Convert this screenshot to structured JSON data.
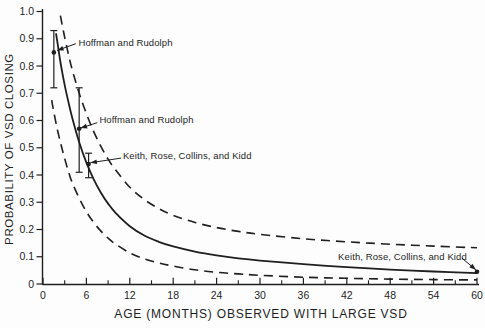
{
  "figure": {
    "background": "#fdfdfd",
    "ink_color": "#1f1f1f"
  },
  "chart_data": {
    "type": "line",
    "title": "",
    "xlabel": "AGE (MONTHS) OBSERVED WITH LARGE VSD",
    "ylabel": "PROBABILITY OF VSD CLOSING",
    "xlim": [
      0,
      60
    ],
    "ylim": [
      0,
      1.0
    ],
    "grid": false,
    "legend_position": "none",
    "x_ticks_major": [
      0,
      6,
      12,
      18,
      24,
      30,
      36,
      42,
      48,
      54,
      60
    ],
    "x_tick_labels": [
      "0",
      "6",
      "12",
      "18",
      "24",
      "30",
      "36",
      "42",
      "48",
      "54",
      "60"
    ],
    "x_ticks_minor": [
      3,
      9,
      15,
      21,
      27,
      33,
      39,
      45,
      51,
      57
    ],
    "y_ticks": [
      0,
      0.1,
      0.2,
      0.3,
      0.4,
      0.5,
      0.6,
      0.7,
      0.8,
      0.9,
      1.0
    ],
    "y_tick_labels": [
      "0",
      "0.1",
      "0.2",
      "0.3",
      "0.4",
      "0.5",
      "0.6",
      "0.7",
      "0.8",
      "0.9",
      "1.0"
    ],
    "series": [
      {
        "name": "estimated probability of closure",
        "style": "solid",
        "x": [
          1.8,
          2,
          2.5,
          3,
          3.5,
          4,
          5,
          6,
          7,
          8,
          9,
          10,
          12,
          14,
          16,
          18,
          21,
          24,
          27,
          30,
          36,
          42,
          48,
          54,
          60
        ],
        "y": [
          0.92,
          0.885,
          0.8,
          0.73,
          0.67,
          0.615,
          0.52,
          0.445,
          0.385,
          0.335,
          0.295,
          0.262,
          0.212,
          0.178,
          0.155,
          0.138,
          0.119,
          0.105,
          0.094,
          0.086,
          0.073,
          0.062,
          0.053,
          0.046,
          0.04
        ]
      },
      {
        "name": "upper confidence bound",
        "style": "dashed",
        "x": [
          2.4,
          2.7,
          3,
          3.5,
          4,
          5,
          6,
          7,
          8,
          9,
          10,
          12,
          14,
          16,
          18,
          21,
          24,
          27,
          30,
          36,
          42,
          48,
          54,
          60
        ],
        "y": [
          0.985,
          0.945,
          0.905,
          0.845,
          0.79,
          0.7,
          0.625,
          0.56,
          0.505,
          0.458,
          0.42,
          0.355,
          0.31,
          0.277,
          0.252,
          0.226,
          0.207,
          0.193,
          0.182,
          0.166,
          0.155,
          0.146,
          0.139,
          0.133
        ]
      },
      {
        "name": "lower confidence bound",
        "style": "dashed",
        "x": [
          1.2,
          1.5,
          2,
          2.5,
          3,
          3.5,
          4,
          5,
          6,
          7,
          8,
          9,
          10,
          12,
          14,
          16,
          18,
          21,
          24,
          27,
          30,
          36,
          42,
          48,
          54,
          60
        ],
        "y": [
          0.675,
          0.63,
          0.565,
          0.51,
          0.46,
          0.415,
          0.375,
          0.315,
          0.265,
          0.226,
          0.194,
          0.168,
          0.147,
          0.114,
          0.092,
          0.077,
          0.066,
          0.052,
          0.043,
          0.037,
          0.032,
          0.025,
          0.021,
          0.018,
          0.016,
          0.015
        ]
      }
    ],
    "points": [
      {
        "source": "Hoffman and Rudolph",
        "month": 1.5,
        "prob": 0.85,
        "ci_low": 0.72,
        "ci_high": 0.93
      },
      {
        "source": "Hoffman and Rudolph",
        "month": 5.0,
        "prob": 0.57,
        "ci_low": 0.41,
        "ci_high": 0.72
      },
      {
        "source": "Keith, Rose, Collins, and Kidd",
        "month": 6.3,
        "prob": 0.44,
        "ci_low": 0.39,
        "ci_high": 0.48
      },
      {
        "source": "Keith, Rose, Collins, and Kidd",
        "month": 60,
        "prob": 0.045,
        "ci_low": null,
        "ci_high": null
      }
    ],
    "annotations": [
      {
        "text": "Hoffman and Rudolph",
        "label": {
          "month": 4.9,
          "prob": 0.886
        },
        "anchor": "start",
        "leader": {
          "from": {
            "month": 4.55,
            "prob": 0.882
          },
          "to": {
            "month": 1.95,
            "prob": 0.857
          }
        }
      },
      {
        "text": "Hoffman and Rudolph",
        "label": {
          "month": 7.8,
          "prob": 0.605
        },
        "anchor": "start",
        "leader": {
          "from": {
            "month": 7.5,
            "prob": 0.592
          },
          "to": {
            "month": 5.2,
            "prob": 0.572
          }
        }
      },
      {
        "text": "Keith, Rose, Collins, and Kidd",
        "label": {
          "month": 11.05,
          "prob": 0.473
        },
        "anchor": "start",
        "leader": {
          "from": {
            "month": 10.8,
            "prob": 0.462
          },
          "to": {
            "month": 6.55,
            "prob": 0.445
          }
        }
      },
      {
        "text": "Keith, Rose, Collins, and Kidd",
        "label": {
          "month": 40.8,
          "prob": 0.101
        },
        "anchor": "start",
        "leader": {
          "from": {
            "month": 57.9,
            "prob": 0.0954
          },
          "to": {
            "month": 59.85,
            "prob": 0.052
          }
        }
      }
    ]
  }
}
